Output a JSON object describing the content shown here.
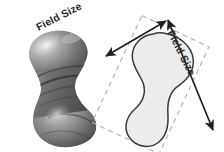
{
  "figure": {
    "name": "field-size-illustration",
    "background_color": "#ffffff",
    "panels": [
      {
        "id": "photo-panel",
        "label": "three-dimensional part rendering",
        "type": "grayscale-rendering",
        "subject": "spool / bone shaped turned part",
        "colors": {
          "highlight": "#d9d9d9",
          "midtone": "#8a8a8a",
          "shadow": "#3d3d3d",
          "deep_shadow": "#2a2a2a"
        }
      },
      {
        "id": "diagram-panel",
        "label": "silhouette with field size bounding box",
        "type": "line-diagram",
        "silhouette": {
          "fill_color": "#ededed",
          "stroke_color": "#3a3a3a"
        },
        "bounding_box": {
          "style": "dashed",
          "stroke_color": "#b4b4b4",
          "rotation_degrees": 25
        }
      }
    ]
  },
  "labels": {
    "field_size_top": "Field Size",
    "field_size_right": "Field Size"
  },
  "annotations": {
    "arrow_top": {
      "name": "field-size-arrow-width",
      "style": "double-headed",
      "color": "#1f1f1f",
      "orientation": "diagonal up-right"
    },
    "arrow_right": {
      "name": "field-size-arrow-length",
      "style": "double-headed",
      "color": "#1f1f1f",
      "orientation": "diagonal down-right"
    }
  },
  "colors": {
    "background": "#ffffff",
    "text": "#2b2b2b",
    "arrow": "#1f1f1f",
    "dash": "#b4b4b4",
    "outline": "#3a3a3a",
    "fill": "#ededed"
  }
}
